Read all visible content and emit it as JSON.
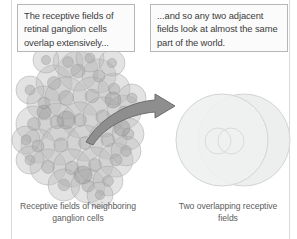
{
  "figure": {
    "title": "Receptive fields of retinal ganglion cells overlap",
    "background_color": "#ffffff"
  },
  "callouts": [
    {
      "id": "left",
      "text": "The receptive fields of retinal ganglion cells overlap extensively...",
      "border_color": "#b6b6b6",
      "background_color": "#fbfbfb"
    },
    {
      "id": "right",
      "text": "...and so any two adjacent fields look at almost the same part of the world.",
      "border_color": "#b6b6b6",
      "background_color": "#fbfbfb"
    }
  ],
  "captions": [
    {
      "id": "left",
      "text": "Receptive fields of neighboring ganglion cells",
      "color": "#5c5c5c"
    },
    {
      "id": "right",
      "text": "Two overlapping receptive fields",
      "color": "#5c5c5c"
    }
  ],
  "arrow": {
    "name": "curved-arrow",
    "direction": "left-to-right",
    "fill_color": "#8e8e8e",
    "stroke_color": "#6d6d6d"
  },
  "diagram_data": {
    "type": "diagram",
    "left_panel": {
      "label": "cluster of overlapping receptive fields",
      "field_count": 34,
      "field_fill": "#bcbcbc",
      "field_stroke": "#9a9a9a",
      "center_fill": "#a6a6a6",
      "opacity": 0.45
    },
    "right_panel": {
      "label": "two overlapping receptive fields",
      "field_count": 2,
      "field_fill": "#eceded",
      "field_stroke": "#d2d4d4",
      "center_stroke": "#d8d9d9",
      "circles": [
        {
          "cx": 222,
          "cy": 140,
          "r": 46
        },
        {
          "cx": 244,
          "cy": 140,
          "r": 46
        }
      ],
      "centers": [
        {
          "cx": 218,
          "cy": 141,
          "r": 13
        },
        {
          "cx": 231,
          "cy": 141,
          "r": 13
        }
      ]
    }
  }
}
